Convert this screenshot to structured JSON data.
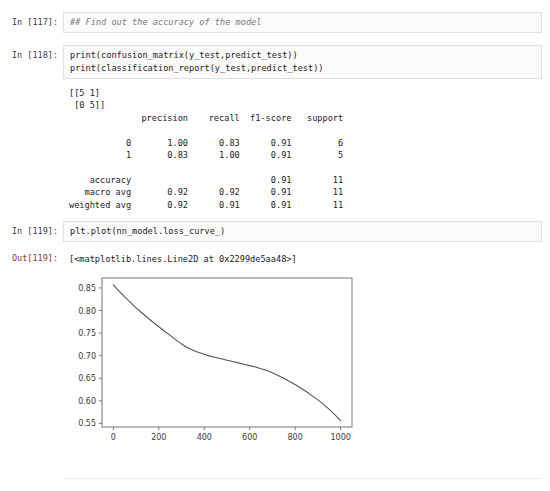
{
  "notebook": {
    "cells": [
      {
        "id": "cell-117",
        "prompt": "In [117]:",
        "type": "code",
        "source": "## Find out the accuracy of the model"
      },
      {
        "id": "cell-118",
        "prompt": "In [118]:",
        "type": "code",
        "source_line_1": "print(confusion_matrix(y_test,predict_test))",
        "source_line_2": "print(classification_report(y_test,predict_test))",
        "stdout": "[[5 1]\n [0 5]]\n              precision    recall  f1-score   support\n\n           0       1.00      0.83      0.91         6\n           1       0.83      1.00      0.91         5\n\n    accuracy                           0.91        11\n   macro avg       0.92      0.92      0.91        11\nweighted avg       0.92      0.91      0.91        11\n"
      },
      {
        "id": "cell-119",
        "prompt_in": "In [119]:",
        "prompt_out": "Out[119]:",
        "type": "code",
        "source": "plt.plot(nn_model.loss_curve_)",
        "result_repr": "[<matplotlib.lines.Line2D at 0x2299de5aa48>]"
      }
    ]
  },
  "classification_report": {
    "confusion_matrix": [
      [
        5,
        1
      ],
      [
        0,
        5
      ]
    ],
    "columns": [
      "precision",
      "recall",
      "f1-score",
      "support"
    ],
    "rows": [
      {
        "label": "0",
        "precision": "1.00",
        "recall": "0.83",
        "f1": "0.91",
        "support": "6"
      },
      {
        "label": "1",
        "precision": "0.83",
        "recall": "1.00",
        "f1": "0.91",
        "support": "5"
      },
      {
        "label": "accuracy",
        "precision": "",
        "recall": "",
        "f1": "0.91",
        "support": "11"
      },
      {
        "label": "macro avg",
        "precision": "0.92",
        "recall": "0.92",
        "f1": "0.91",
        "support": "11"
      },
      {
        "label": "weighted avg",
        "precision": "0.92",
        "recall": "0.91",
        "f1": "0.91",
        "support": "11"
      }
    ]
  },
  "chart_data": {
    "type": "line",
    "title": "",
    "xlabel": "",
    "ylabel": "",
    "xlim": [
      -50,
      1050
    ],
    "ylim": [
      0.542,
      0.872
    ],
    "xticks": [
      0,
      200,
      400,
      600,
      800,
      1000
    ],
    "yticks": [
      0.55,
      0.6,
      0.65,
      0.7,
      0.75,
      0.8,
      0.85
    ],
    "xtick_labels": [
      "0",
      "200",
      "400",
      "600",
      "800",
      "1000"
    ],
    "ytick_labels": [
      "0.55",
      "0.60",
      "0.65",
      "0.70",
      "0.75",
      "0.80",
      "0.85"
    ],
    "grid": false,
    "legend": null,
    "line_color": "#555555",
    "series": [
      {
        "name": "loss_curve_",
        "x": [
          0,
          25,
          50,
          75,
          100,
          125,
          150,
          175,
          200,
          225,
          250,
          275,
          300,
          325,
          350,
          375,
          400,
          425,
          450,
          475,
          500,
          525,
          550,
          575,
          600,
          625,
          650,
          675,
          700,
          725,
          750,
          775,
          800,
          825,
          850,
          875,
          900,
          925,
          950,
          975,
          1000
        ],
        "y": [
          0.857,
          0.843,
          0.83,
          0.818,
          0.806,
          0.795,
          0.784,
          0.774,
          0.764,
          0.754,
          0.745,
          0.735,
          0.726,
          0.718,
          0.712,
          0.707,
          0.703,
          0.699,
          0.696,
          0.693,
          0.69,
          0.687,
          0.684,
          0.681,
          0.678,
          0.675,
          0.671,
          0.667,
          0.662,
          0.656,
          0.65,
          0.643,
          0.636,
          0.628,
          0.62,
          0.611,
          0.602,
          0.592,
          0.581,
          0.569,
          0.556
        ]
      }
    ]
  }
}
